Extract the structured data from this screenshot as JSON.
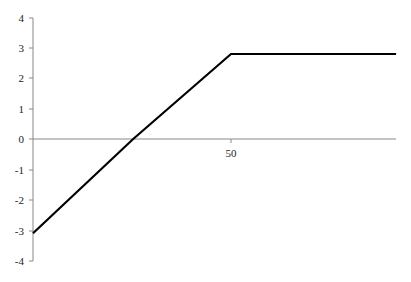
{
  "chart_data": {
    "type": "line",
    "title": "",
    "xlabel": "",
    "ylabel": "",
    "x_ticks": [
      50
    ],
    "y_ticks": [
      4,
      3,
      2,
      1,
      0,
      -1,
      -2,
      -3,
      -4
    ],
    "xlim": [
      0,
      91.7
    ],
    "ylim": [
      -4,
      4
    ],
    "grid": false,
    "legend": null,
    "series": [
      {
        "name": "payoff",
        "color": "#000000",
        "points": [
          {
            "x": 0,
            "y": -3.1
          },
          {
            "x": 25.3,
            "y": 0
          },
          {
            "x": 50,
            "y": 2.8
          },
          {
            "x": 91.7,
            "y": 2.8
          }
        ]
      }
    ]
  },
  "labels": {
    "x_tick_50": "50",
    "y_tick_4": "4",
    "y_tick_3": "3",
    "y_tick_2": "2",
    "y_tick_1": "1",
    "y_tick_0": "0",
    "y_tick_m1": "-1",
    "y_tick_m2": "-2",
    "y_tick_m3": "-3",
    "y_tick_m4": "-4"
  }
}
